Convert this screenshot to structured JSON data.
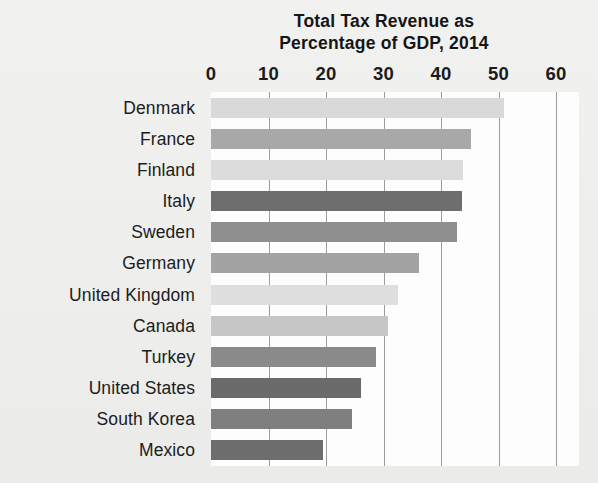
{
  "chart_data": {
    "type": "bar",
    "orientation": "horizontal",
    "title": "Total Tax Revenue as Percentage of GDP, 2014",
    "title_lines": [
      "Total Tax Revenue as",
      "Percentage of GDP, 2014"
    ],
    "xlabel": "",
    "ylabel": "",
    "xlim": [
      0,
      60
    ],
    "xticks": [
      0,
      10,
      20,
      30,
      40,
      50,
      60
    ],
    "xtick_labels": [
      "0",
      "10",
      "20",
      "30",
      "40",
      "50",
      "60"
    ],
    "grid": "vertical",
    "legend": "none",
    "categories": [
      "Denmark",
      "France",
      "Finland",
      "Italy",
      "Sweden",
      "Germany",
      "United Kingdom",
      "Canada",
      "Turkey",
      "United States",
      "South Korea",
      "Mexico"
    ],
    "values": [
      50.9,
      45.2,
      43.9,
      43.6,
      42.7,
      36.1,
      32.6,
      30.8,
      28.7,
      26.0,
      24.6,
      19.5
    ],
    "bar_colors": [
      "#d9d9d9",
      "#a8a8a8",
      "#dcdcdc",
      "#6e6e6e",
      "#8f8f8f",
      "#a3a3a3",
      "#dedede",
      "#c6c6c6",
      "#8a8a8a",
      "#6a6a6a",
      "#7f7f7f",
      "#6d6d6d"
    ]
  },
  "style": {
    "page_background": "#eeeeec",
    "plot_background": "#fdfdfd",
    "gridline_color": "#9d9d9d",
    "text_color": "#1b1b1b"
  }
}
